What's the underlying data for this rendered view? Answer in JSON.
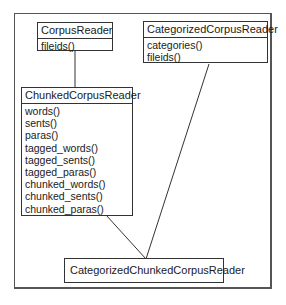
{
  "diagram": {
    "type": "uml-class-inheritance",
    "classes": [
      {
        "id": "corpus_reader",
        "name": "CorpusReader",
        "methods": [
          "fileids()"
        ]
      },
      {
        "id": "categorized_corpus_reader",
        "name": "CategorizedCorpusReader",
        "methods": [
          "categories()",
          "fileids()"
        ]
      },
      {
        "id": "chunked_corpus_reader",
        "name": "ChunkedCorpusReader",
        "methods": [
          "words()",
          "sents()",
          "paras()",
          "tagged_words()",
          "tagged_sents()",
          "tagged_paras()",
          "chunked_words()",
          "chunked_sents()",
          "chunked_paras()"
        ]
      },
      {
        "id": "categorized_chunked_corpus_reader",
        "name": "CategorizedChunkedCorpusReader",
        "methods": []
      }
    ],
    "relations": [
      {
        "from": "ChunkedCorpusReader",
        "to": "CorpusReader",
        "kind": "inherits"
      },
      {
        "from": "CategorizedChunkedCorpusReader",
        "to": "ChunkedCorpusReader",
        "kind": "inherits"
      },
      {
        "from": "CategorizedChunkedCorpusReader",
        "to": "CategorizedCorpusReader",
        "kind": "inherits"
      }
    ]
  }
}
